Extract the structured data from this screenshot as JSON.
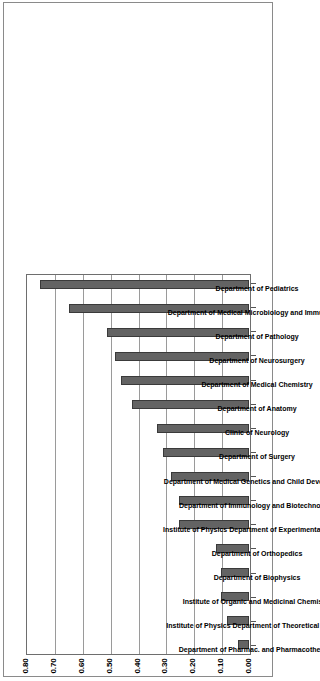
{
  "chart_data": {
    "type": "bar",
    "title": "",
    "xlabel": "",
    "ylabel": "",
    "ylim": [
      0.0,
      0.8
    ],
    "grid": true,
    "legend": "none",
    "orientation": "vertical-bars-rotated-90",
    "tick_labels": [
      "0.00",
      "0.10",
      "0.20",
      "0.30",
      "0.40",
      "0.50",
      "0.60",
      "0.70",
      "0.80"
    ],
    "tick_values": [
      0.0,
      0.1,
      0.2,
      0.3,
      0.4,
      0.5,
      0.6,
      0.7,
      0.8
    ],
    "categories": [
      "Department of Pharmac. and Pharmacotherapy",
      "Institute of Physics Department of Theoretical Physics",
      "Institute of Organic and Medicinal Chemistry",
      "Department of Biophysics",
      "Department of Orthopedics",
      "Institute of Physics Department of Experimental Physics",
      "Department of Immunology and Biotechnology",
      "Department of Medical Genetics and Child Development",
      "Department of Surgery",
      "Clinic of Neurology",
      "Department of Anatomy",
      "Department of Medical Chemistry",
      "Department of Neurosurgery",
      "Department of Pathology",
      "Department of Medical Microbiology and Immunology",
      "Department of Pediatrics"
    ],
    "values": [
      0.04,
      0.08,
      0.1,
      0.1,
      0.12,
      0.25,
      0.25,
      0.28,
      0.31,
      0.33,
      0.42,
      0.46,
      0.48,
      0.51,
      0.645,
      0.75
    ],
    "colors": {
      "bar_fill": "#636363",
      "bar_border": "#3a3a3a",
      "gridline": "#9a9a9a",
      "plot_border": "#6e6e6e",
      "frame": "#8a8a8a",
      "text": "#000000",
      "background": "#ffffff"
    }
  }
}
